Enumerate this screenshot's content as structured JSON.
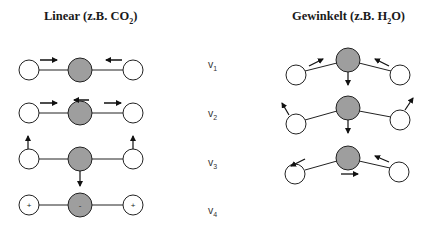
{
  "titles": {
    "linear": {
      "prefix": "Linear (z.B. CO",
      "sub": "2",
      "suffix": ")"
    },
    "bent": {
      "prefix": "Gewinkelt (z.B. H",
      "sub": "2",
      "suffix": "O)"
    }
  },
  "modes": [
    {
      "symbol": "v",
      "index": "1"
    },
    {
      "symbol": "v",
      "index": "2"
    },
    {
      "symbol": "v",
      "index": "3"
    },
    {
      "symbol": "v",
      "index": "4"
    }
  ],
  "charges": {
    "outer": "+",
    "center": "-"
  },
  "colors": {
    "center_atom": "#9e9e9e",
    "outer_atom": "#ffffff",
    "stroke": "#222222"
  }
}
